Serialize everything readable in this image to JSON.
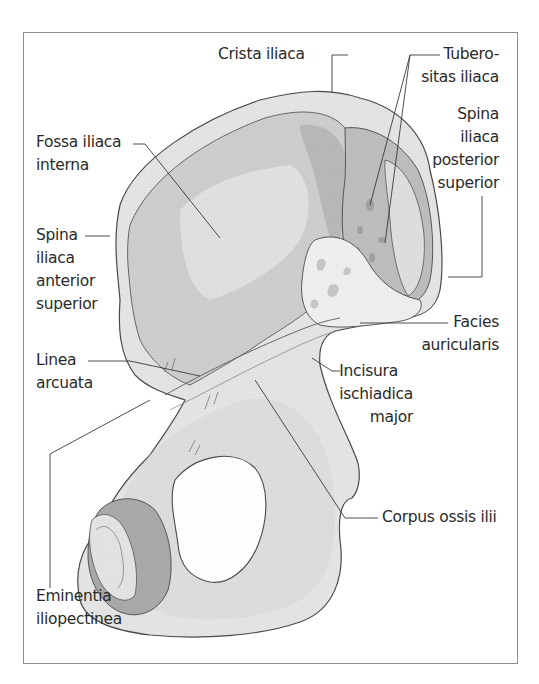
{
  "figure": {
    "colors": {
      "frame": "#8c8c8c",
      "bone_light": "#e6e6e6",
      "bone_mid": "#cfcfcf",
      "bone_dark": "#a9a9a9",
      "outline": "#4a4a4a",
      "leader": "#3a3a3a"
    },
    "labels": {
      "crista_iliaca": {
        "lines": [
          "Crista iliaca"
        ]
      },
      "tuberositas_iliaca": {
        "lines": [
          "Tubero-",
          "sitas iliaca"
        ]
      },
      "fossa_iliaca_interna": {
        "lines": [
          "Fossa iliaca",
          "interna"
        ]
      },
      "spina_iliaca_posterior_superior": {
        "lines": [
          "Spina",
          "iliaca",
          "posterior",
          "superior"
        ]
      },
      "spina_iliaca_anterior_superior": {
        "lines": [
          "Spina",
          "iliaca",
          "anterior",
          "superior"
        ]
      },
      "facies_auricularis": {
        "lines": [
          "Facies",
          "auricularis"
        ]
      },
      "linea_arcuata": {
        "lines": [
          "Linea",
          "arcuata"
        ]
      },
      "incisura_ischiadica_major": {
        "lines": [
          "Incisura",
          "ischiadica",
          "major"
        ]
      },
      "corpus_ossis_ilii": {
        "lines": [
          "Corpus ossis ilii"
        ]
      },
      "eminentia_iliopectinea": {
        "lines": [
          "Eminentia",
          "iliopectinea"
        ]
      }
    }
  }
}
